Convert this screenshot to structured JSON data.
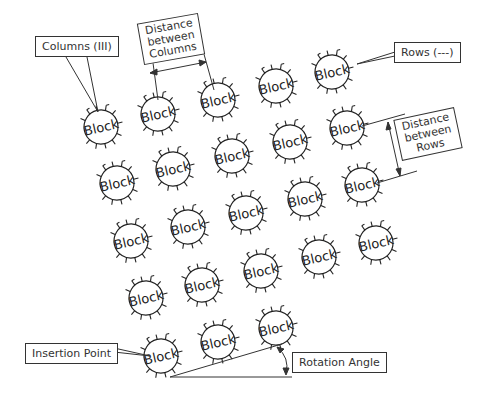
{
  "diagram": {
    "block_label": "Block",
    "rotation_deg": -13,
    "rows": 5,
    "columns": 5,
    "blocks": [
      {
        "x": 101,
        "y": 127
      },
      {
        "x": 158,
        "y": 114
      },
      {
        "x": 218,
        "y": 100
      },
      {
        "x": 276,
        "y": 86
      },
      {
        "x": 332,
        "y": 72
      },
      {
        "x": 117,
        "y": 183
      },
      {
        "x": 173,
        "y": 169
      },
      {
        "x": 232,
        "y": 156
      },
      {
        "x": 290,
        "y": 142
      },
      {
        "x": 347,
        "y": 128
      },
      {
        "x": 131,
        "y": 241
      },
      {
        "x": 188,
        "y": 227
      },
      {
        "x": 246,
        "y": 213
      },
      {
        "x": 305,
        "y": 199
      },
      {
        "x": 362,
        "y": 185
      },
      {
        "x": 146,
        "y": 298
      },
      {
        "x": 202,
        "y": 285
      },
      {
        "x": 261,
        "y": 271
      },
      {
        "x": 319,
        "y": 257
      },
      {
        "x": 376,
        "y": 243
      },
      {
        "x": 161,
        "y": 356
      },
      {
        "x": 218,
        "y": 342
      },
      {
        "x": 276,
        "y": 328
      }
    ],
    "callouts": {
      "columns": "Columns (III)",
      "rows": "Rows (---)",
      "distance_columns": [
        "Distance",
        "between",
        "Columns"
      ],
      "distance_rows": [
        "Distance",
        "between",
        "Rows"
      ],
      "insertion_point": "Insertion Point",
      "rotation_angle": "Rotation Angle"
    }
  }
}
